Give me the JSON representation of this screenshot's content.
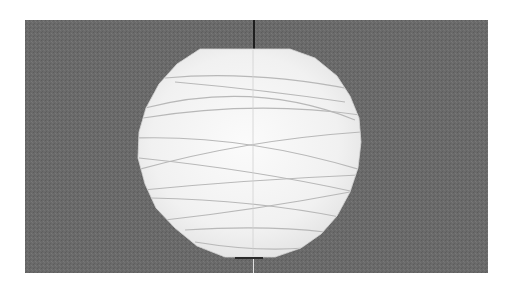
{
  "scene": {
    "subject": "paper lantern",
    "background_color": "#6a6a6a",
    "frame_color": "#ffffff",
    "lantern_color": "#f4f4f4",
    "rib_color": "#b8b8b8",
    "cord_color": "#1e1e1e"
  },
  "geometry": {
    "photo": {
      "x": 25,
      "y": 20,
      "width": 463,
      "height": 253
    },
    "lantern": {
      "cx": 225,
      "cy": 135,
      "r": 106
    }
  }
}
